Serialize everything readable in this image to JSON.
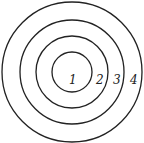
{
  "diagram": {
    "type": "concentric-circles",
    "center": [
      72,
      72
    ],
    "stroke_color": "#222222",
    "rings": [
      {
        "label": "1",
        "radius": 20
      },
      {
        "label": "2",
        "radius": 36
      },
      {
        "label": "3",
        "radius": 52
      },
      {
        "label": "4",
        "radius": 70
      }
    ]
  }
}
